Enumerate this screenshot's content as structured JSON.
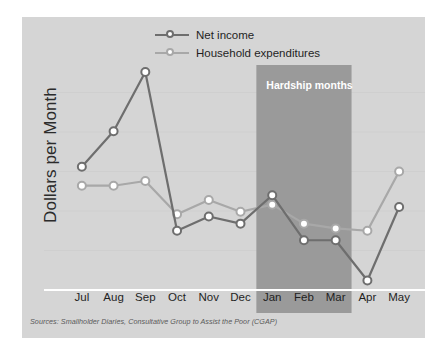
{
  "chart_data": {
    "type": "line",
    "title": "",
    "xlabel": "",
    "ylabel": "Dollars per Month",
    "categories": [
      "Jul",
      "Aug",
      "Sep",
      "Oct",
      "Nov",
      "Dec",
      "Jan",
      "Feb",
      "Mar",
      "Apr",
      "May"
    ],
    "grid": true,
    "legend_position": "top-center",
    "ylim": [
      0,
      100
    ],
    "y_axis_ticks_labeled": false,
    "series": [
      {
        "name": "Net income",
        "color": "#6e6e6e",
        "marker": "open-circle",
        "values": [
          52,
          67,
          92,
          25,
          31,
          28,
          40,
          21,
          21,
          4,
          35
        ]
      },
      {
        "name": "Household expenditures",
        "color": "#a8a8a8",
        "marker": "open-circle",
        "values": [
          44,
          44,
          46,
          32,
          38,
          33,
          36,
          28,
          26,
          25,
          50
        ]
      }
    ],
    "annotations": [
      {
        "type": "span-band",
        "label": "Hardship months",
        "from": "Jan",
        "to": "Mar",
        "color": "#9a9a9a",
        "label_color": "#ffffff"
      }
    ],
    "source_note": "Sources: Smallholder Diaries, Consultative Group to Assist the Poor (CGAP)"
  },
  "colors": {
    "panel_background": "#d5d5d5",
    "page_background": "#ffffff",
    "net_income": "#6e6e6e",
    "household_expenditures": "#a8a8a8",
    "hardship_band": "#9a9a9a",
    "axis_line": "#ffffff",
    "gridline": "#cbcbcb",
    "tick_text": "#1f1f1f",
    "source_text": "#5a5a5a"
  },
  "legend": {
    "items": [
      {
        "label": "Net income",
        "series_key": "net_income"
      },
      {
        "label": "Household expenditures",
        "series_key": "household_expenditures"
      }
    ]
  },
  "axes": {
    "y_label": "Dollars per Month",
    "x_tick_labels": [
      "Jul",
      "Aug",
      "Sep",
      "Oct",
      "Nov",
      "Dec",
      "Jan",
      "Feb",
      "Mar",
      "Apr",
      "May"
    ]
  },
  "band": {
    "label": "Hardship months"
  },
  "footer": {
    "source": "Sources: Smallholder Diaries, Consultative Group to Assist the Poor (CGAP)"
  }
}
